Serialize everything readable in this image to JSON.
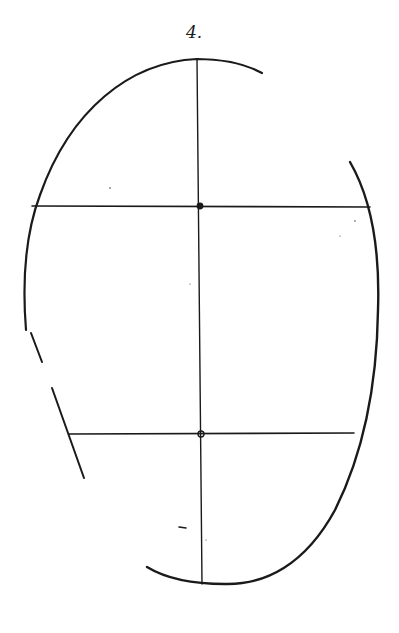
{
  "figure": {
    "number_label": "4.",
    "ink_color": "#1a1a1a",
    "background": "#ffffff"
  },
  "markers": [
    {
      "name": "upper-center-dot",
      "x": 200,
      "y": 206
    },
    {
      "name": "lower-center-circle",
      "x": 201,
      "y": 434
    }
  ],
  "lines": {
    "vertical_axis": {
      "x1": 197,
      "y1": 59,
      "x2": 202,
      "y2": 584
    },
    "upper_horizontal": {
      "x1": 32,
      "y1": 206,
      "x2": 370,
      "y2": 207
    },
    "lower_horizontal": {
      "x1": 69,
      "y1": 434,
      "x2": 354,
      "y2": 433
    }
  }
}
